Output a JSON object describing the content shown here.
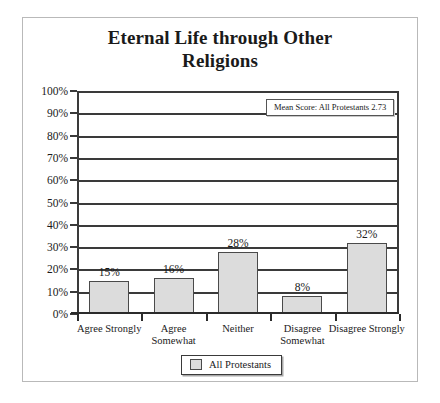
{
  "chart_data": {
    "type": "bar",
    "title": "Eternal Life through Other Religions",
    "title_lines": [
      "Eternal Life through Other",
      "Religions"
    ],
    "categories": [
      "Agree Strongly",
      "Agree Somewhat",
      "Neither",
      "Disagree Somewhat",
      "Disagree Strongly"
    ],
    "values": [
      15,
      16,
      28,
      8,
      32
    ],
    "value_labels": [
      "15%",
      "16%",
      "28%",
      "8%",
      "32%"
    ],
    "series": [
      {
        "name": "All Protestants",
        "values": [
          15,
          16,
          28,
          8,
          32
        ]
      }
    ],
    "xlabel": "",
    "ylabel": "",
    "ylim": [
      0,
      100
    ],
    "ytick_labels": [
      "100%",
      "90%",
      "80%",
      "70%",
      "60%",
      "50%",
      "40%",
      "30%",
      "20%",
      "10%",
      "0%"
    ],
    "ytick_values": [
      100,
      90,
      80,
      70,
      60,
      50,
      40,
      30,
      20,
      10,
      0
    ],
    "grid": true,
    "legend_position": "bottom-center",
    "annotations": [
      {
        "text": "Mean Score: All Protestants 2.73",
        "position": "top-right-inside-plot"
      }
    ],
    "colors": {
      "bar_fill": "#dcdcdc",
      "bar_border": "#4a4a4a",
      "gridline": "#3a3a3a",
      "axis": "#2b2b2b",
      "card_border": "#b9b9b9",
      "background": "#ffffff",
      "text": "#1a1a1a"
    }
  },
  "legend": {
    "entries": [
      {
        "label": "All Protestants",
        "swatch": "#dcdcdc"
      }
    ]
  },
  "annotation": {
    "mean_score_text": "Mean Score: All Protestants 2.73"
  }
}
